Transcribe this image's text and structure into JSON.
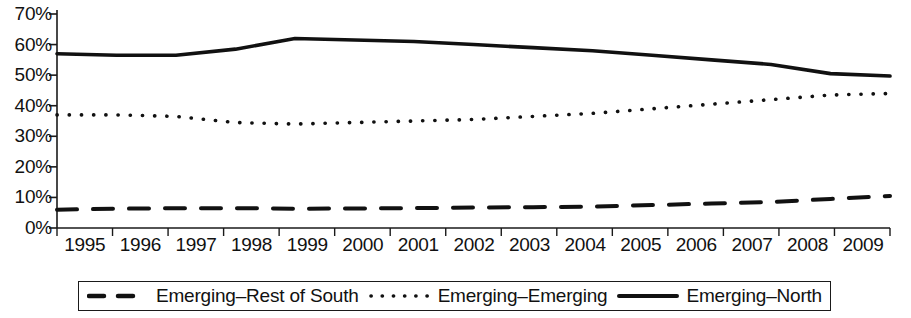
{
  "chart_data": {
    "type": "line",
    "title": "",
    "subtitle": "",
    "xlabel": "",
    "ylabel": "",
    "categories": [
      "1995",
      "1996",
      "1997",
      "1998",
      "1999",
      "2000",
      "2001",
      "2002",
      "2003",
      "2004",
      "2005",
      "2006",
      "2007",
      "2008",
      "2009"
    ],
    "ylim": [
      0,
      70
    ],
    "ytick_labels": [
      "70%",
      "60%",
      "50%",
      "40%",
      "30%",
      "20%",
      "10%",
      "0%"
    ],
    "ytick_values": [
      70,
      60,
      50,
      40,
      30,
      20,
      10,
      0
    ],
    "grid": false,
    "legend_position": "bottom",
    "value_suffix": "%",
    "series": [
      {
        "name": "Emerging–Rest of South",
        "style": "dashed",
        "color": "#111111",
        "legend_icon": "dashed-line-icon",
        "values": [
          6.0,
          6.3,
          6.5,
          6.5,
          6.3,
          6.4,
          6.5,
          6.7,
          6.8,
          7.0,
          7.5,
          8.0,
          8.5,
          9.5,
          10.5
        ]
      },
      {
        "name": "Emerging–Emerging",
        "style": "dotted",
        "color": "#111111",
        "legend_icon": "dotted-line-icon",
        "values": [
          37.0,
          37.0,
          36.5,
          34.5,
          34.0,
          34.5,
          35.0,
          35.5,
          36.5,
          37.5,
          39.0,
          40.5,
          42.0,
          43.5,
          44.0
        ]
      },
      {
        "name": "Emerging–North",
        "style": "solid",
        "color": "#111111",
        "legend_icon": "solid-line-icon",
        "values": [
          57.0,
          56.5,
          56.5,
          58.5,
          62.0,
          61.5,
          61.0,
          60.0,
          59.0,
          58.0,
          56.5,
          55.0,
          53.5,
          50.5,
          49.7
        ]
      }
    ]
  },
  "axis": {
    "y_ticks": [
      "70%",
      "60%",
      "50%",
      "40%",
      "30%",
      "20%",
      "10%",
      "0%"
    ],
    "x_ticks": [
      "1995",
      "1996",
      "1997",
      "1998",
      "1999",
      "2000",
      "2001",
      "2002",
      "2003",
      "2004",
      "2005",
      "2006",
      "2007",
      "2008",
      "2009"
    ]
  },
  "legend": {
    "items": [
      {
        "label": "Emerging–Rest of South",
        "style": "dashed"
      },
      {
        "label": "Emerging–Emerging",
        "style": "dotted"
      },
      {
        "label": "Emerging–North",
        "style": "solid"
      }
    ]
  }
}
